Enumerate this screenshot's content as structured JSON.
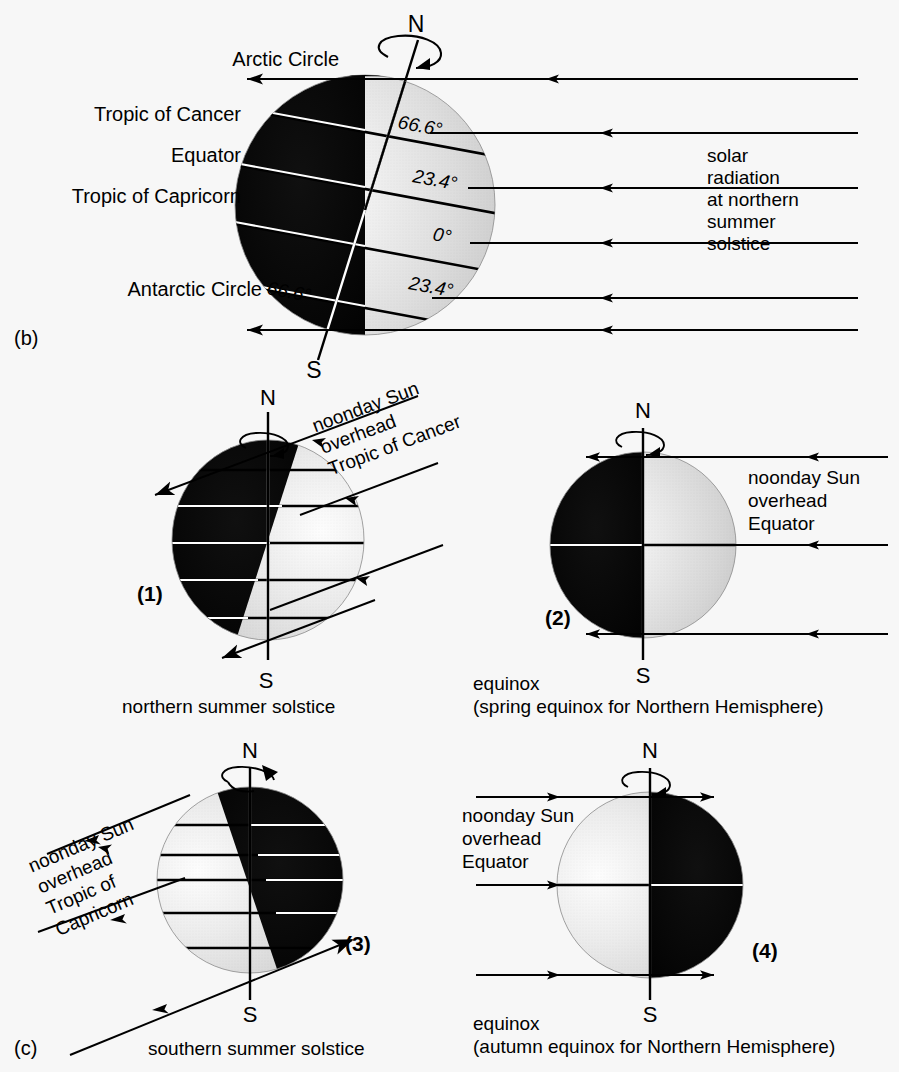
{
  "figure": {
    "panel_b_label": "(b)",
    "panel_c_label": "(c)"
  },
  "main_diagram": {
    "pole_north": "N",
    "pole_south": "S",
    "latitude_labels": [
      "Arctic Circle",
      "Tropic of Cancer",
      "Equator",
      "Tropic of Capricorn",
      "Antarctic Circle"
    ],
    "angle_labels": {
      "arctic": "66.6°",
      "cancer": "23.4°",
      "equator": "0°",
      "capricorn": "23.4°",
      "antarctic": "66.6°"
    },
    "radiation_caption": [
      "solar",
      "radiation",
      "at northern",
      "summer",
      "solstice"
    ]
  },
  "panels": [
    {
      "number": "(1)",
      "pole_north": "N",
      "pole_south": "S",
      "annotation": [
        "noonday Sun",
        "overhead",
        "Tropic of Cancer"
      ],
      "caption": [
        "northern summer solstice"
      ],
      "dark_side": "left",
      "tilt": "north-toward-sun"
    },
    {
      "number": "(2)",
      "pole_north": "N",
      "pole_south": "S",
      "annotation": [
        "noonday Sun",
        "overhead",
        "Equator"
      ],
      "caption": [
        "equinox",
        "(spring equinox for Northern Hemisphere)"
      ],
      "dark_side": "left",
      "tilt": "none"
    },
    {
      "number": "(3)",
      "pole_north": "N",
      "pole_south": "S",
      "annotation": [
        "noonday Sun",
        "overhead",
        "Tropic of",
        "Capricorn"
      ],
      "caption": [
        "southern summer solstice"
      ],
      "dark_side": "right",
      "tilt": "north-away-from-sun"
    },
    {
      "number": "(4)",
      "pole_north": "N",
      "pole_south": "S",
      "annotation": [
        "noonday Sun",
        "overhead",
        "Equator"
      ],
      "caption": [
        "equinox",
        "(autumn equinox for Northern Hemisphere)"
      ],
      "dark_side": "right",
      "tilt": "none"
    }
  ],
  "colors": {
    "background": "#f7f7f7",
    "dark_hemisphere": "#0a0a0a",
    "lit_hemisphere_light": "#fbfbfb",
    "lit_hemisphere_mid": "#dcdcdc",
    "lit_hemisphere_edge": "#bdbdbd",
    "stroke": "#000000"
  }
}
